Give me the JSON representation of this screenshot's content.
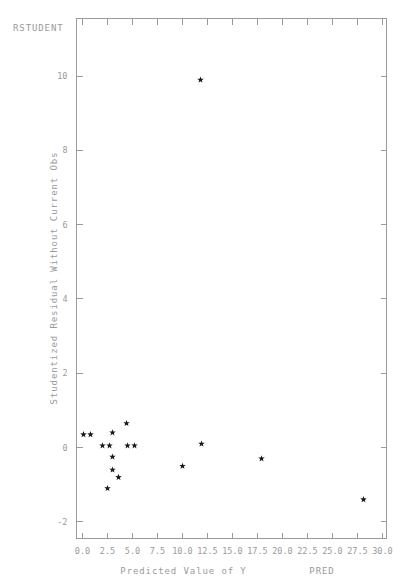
{
  "chart_data": {
    "type": "scatter",
    "title": "",
    "corner_label": "RSTUDENT",
    "series_corner_label": "PRED",
    "xlabel": "Predicted Value of Y",
    "ylabel": "Studentized Residual Without Current Obs",
    "xlim": [
      -0.6,
      30.4
    ],
    "ylim": [
      -2.45,
      11.55
    ],
    "grid": false,
    "legend": null,
    "xticklabels": [
      "0.0",
      "2.5",
      "5.0",
      "7.5",
      "10.0",
      "12.5",
      "15.0",
      "17.5",
      "20.0",
      "22.5",
      "25.0",
      "27.5",
      "30.0"
    ],
    "xticks": [
      0.0,
      2.5,
      5.0,
      7.5,
      10.0,
      12.5,
      15.0,
      17.5,
      20.0,
      22.5,
      25.0,
      27.5,
      30.0
    ],
    "yticklabels": [
      "-2",
      "0",
      "2",
      "4",
      "6",
      "8",
      "10"
    ],
    "yticks": [
      -2,
      0,
      2,
      4,
      6,
      8,
      10
    ],
    "marker": "star",
    "marker_color": "#1a1a1a",
    "points": [
      {
        "x": 0.1,
        "y": 0.35
      },
      {
        "x": 0.8,
        "y": 0.35
      },
      {
        "x": 3.0,
        "y": 0.4
      },
      {
        "x": 4.4,
        "y": 0.65
      },
      {
        "x": 2.0,
        "y": 0.05
      },
      {
        "x": 2.7,
        "y": 0.05
      },
      {
        "x": 4.5,
        "y": 0.05
      },
      {
        "x": 5.2,
        "y": 0.05
      },
      {
        "x": 3.0,
        "y": -0.25
      },
      {
        "x": 3.0,
        "y": -0.6
      },
      {
        "x": 3.6,
        "y": -0.8
      },
      {
        "x": 2.5,
        "y": -1.1
      },
      {
        "x": 10.0,
        "y": -0.5
      },
      {
        "x": 11.9,
        "y": 0.1
      },
      {
        "x": 17.9,
        "y": -0.3
      },
      {
        "x": 28.1,
        "y": -1.4
      },
      {
        "x": 11.8,
        "y": 9.9
      }
    ]
  }
}
